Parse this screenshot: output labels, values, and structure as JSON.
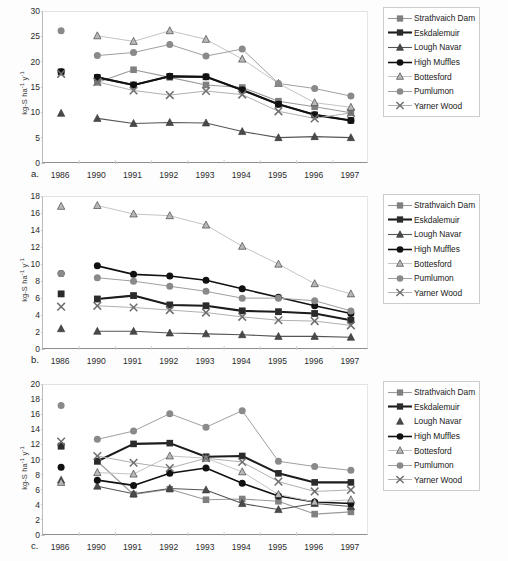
{
  "figure": {
    "panels": [
      "a",
      "b",
      "c"
    ],
    "x_categories": [
      "1986",
      "1990",
      "1991",
      "1992",
      "1993",
      "1994",
      "1995",
      "1996",
      "1997"
    ],
    "y_axis_title": "kg-S ha",
    "y_axis_title_sup1": "-1",
    "y_axis_title_mid": " y",
    "y_axis_title_sup2": "-1",
    "panel_label_a": "a.",
    "panel_label_b": "b.",
    "panel_label_c": "c."
  },
  "legend": {
    "entries": [
      {
        "label": "Strathvaich Dam",
        "marker": "square",
        "color": "#808080",
        "line_color": "#9a9a9a",
        "line_width": 1.1,
        "has_line": true
      },
      {
        "label": "Eskdalemuir",
        "marker": "square",
        "color": "#2b2b2b",
        "line_color": "#1c1c1c",
        "line_width": 2.1,
        "has_line": true
      },
      {
        "label": "Lough Navar",
        "marker": "triangle",
        "color": "#4a4a4a",
        "line_color": "#555555",
        "line_width": 1.1,
        "has_line": true
      },
      {
        "label": "High Muffles",
        "marker": "circle",
        "color": "#111111",
        "line_color": "#111111",
        "line_width": 1.6,
        "has_line": true
      },
      {
        "label": "Bottesford",
        "marker": "triangle",
        "color": "#b8b8b8",
        "line_color": "#c4c4c4",
        "line_width": 1.0,
        "has_line": true
      },
      {
        "label": "Pumlumon",
        "marker": "circle",
        "color": "#8a8a8a",
        "line_color": "#9f9f9f",
        "line_width": 1.0,
        "has_line": true
      },
      {
        "label": "Yarner Wood",
        "marker": "cross",
        "color": "#6e6e6e",
        "line_color": "#b0b0b0",
        "line_width": 1.0,
        "has_line": true
      }
    ],
    "legend_c_lough_navar_has_line": false
  },
  "chart_data": [
    {
      "type": "line",
      "panel": "a",
      "title": "",
      "xlabel": "",
      "ylabel": "kg-S ha-1 y-1",
      "x": [
        "1986",
        "1990",
        "1991",
        "1992",
        "1993",
        "1994",
        "1995",
        "1996",
        "1997"
      ],
      "ylim": [
        0,
        30
      ],
      "yticks": [
        0,
        5,
        10,
        15,
        20,
        25,
        30
      ],
      "grid": false,
      "legend_position": "right-outside",
      "series": [
        {
          "name": "Strathvaich Dam",
          "values": [
            null,
            16.1,
            18.6,
            17.1,
            15.6,
            15.1,
            12.4,
            11.3,
            10.1
          ]
        },
        {
          "name": "Eskdalemuir",
          "values": [
            18.2,
            17.1,
            15.6,
            17.3,
            17.2,
            14.6,
            11.8,
            9.7,
            8.6
          ]
        },
        {
          "name": "Lough Navar",
          "values": [
            10.0,
            9.0,
            8.0,
            8.2,
            8.1,
            6.4,
            5.2,
            5.4,
            5.2
          ]
        },
        {
          "name": "High Muffles",
          "values": [
            18.2,
            17.1,
            15.6,
            17.3,
            17.2,
            14.6,
            11.8,
            9.7,
            8.6
          ]
        },
        {
          "name": "Bottesford",
          "values": [
            null,
            25.3,
            24.2,
            26.3,
            24.6,
            20.7,
            15.9,
            12.1,
            11.2
          ]
        },
        {
          "name": "Pumlumon",
          "values": [
            26.3,
            21.4,
            22.0,
            23.6,
            21.3,
            22.7,
            15.9,
            14.9,
            13.4
          ]
        },
        {
          "name": "Yarner Wood",
          "values": [
            17.8,
            16.2,
            14.5,
            13.6,
            14.4,
            13.7,
            10.4,
            9.0,
            10.1
          ]
        }
      ]
    },
    {
      "type": "line",
      "panel": "b",
      "title": "",
      "xlabel": "",
      "ylabel": "kg-S ha-1 y-1",
      "x": [
        "1986",
        "1990",
        "1991",
        "1992",
        "1993",
        "1994",
        "1995",
        "1996",
        "1997"
      ],
      "ylim": [
        0,
        18
      ],
      "yticks": [
        0,
        2,
        4,
        6,
        8,
        10,
        12,
        14,
        16,
        18
      ],
      "grid": false,
      "legend_position": "right-outside",
      "series": [
        {
          "name": "Strathvaich Dam",
          "values": [
            6.6,
            6.0,
            6.4,
            5.3,
            5.2,
            4.6,
            4.5,
            4.3,
            3.5
          ]
        },
        {
          "name": "Eskdalemuir",
          "values": [
            6.6,
            6.0,
            6.4,
            5.3,
            5.2,
            4.6,
            4.5,
            4.3,
            3.5
          ]
        },
        {
          "name": "Lough Navar",
          "values": [
            2.5,
            2.2,
            2.2,
            2.0,
            1.9,
            1.8,
            1.6,
            1.6,
            1.5
          ]
        },
        {
          "name": "High Muffles",
          "values": [
            9.0,
            9.9,
            8.9,
            8.7,
            8.2,
            7.2,
            6.2,
            5.2,
            4.3
          ]
        },
        {
          "name": "Bottesford",
          "values": [
            16.9,
            17.0,
            16.0,
            15.8,
            14.7,
            12.2,
            10.1,
            7.8,
            6.6
          ]
        },
        {
          "name": "Pumlumon",
          "values": [
            9.0,
            8.5,
            8.1,
            7.5,
            6.9,
            6.1,
            6.1,
            5.8,
            4.6
          ]
        },
        {
          "name": "Yarner Wood",
          "values": [
            5.1,
            5.2,
            5.0,
            4.7,
            4.4,
            3.9,
            3.5,
            3.4,
            2.9
          ]
        }
      ]
    },
    {
      "type": "line",
      "panel": "c",
      "title": "",
      "xlabel": "",
      "ylabel": "kg-S ha-1 y-1",
      "x": [
        "1986",
        "1990",
        "1991",
        "1992",
        "1993",
        "1994",
        "1995",
        "1996",
        "1997"
      ],
      "ylim": [
        0,
        20
      ],
      "yticks": [
        0,
        2,
        4,
        6,
        8,
        10,
        12,
        14,
        16,
        18,
        20
      ],
      "grid": false,
      "legend_position": "right-outside",
      "series": [
        {
          "name": "Strathvaich Dam",
          "values": [
            11.9,
            9.9,
            5.5,
            6.2,
            4.8,
            4.9,
            4.6,
            2.9,
            3.2
          ]
        },
        {
          "name": "Eskdalemuir",
          "values": [
            11.9,
            9.9,
            12.2,
            12.3,
            10.5,
            10.6,
            8.3,
            7.1,
            7.1
          ]
        },
        {
          "name": "Lough Navar",
          "values": [
            7.4,
            6.6,
            5.6,
            6.3,
            6.1,
            4.3,
            3.5,
            4.3,
            3.9
          ]
        },
        {
          "name": "High Muffles",
          "values": [
            9.1,
            7.4,
            6.7,
            8.3,
            9.0,
            7.0,
            5.3,
            4.5,
            4.3
          ]
        },
        {
          "name": "Bottesford",
          "values": [
            7.1,
            8.4,
            8.2,
            10.6,
            10.3,
            8.5,
            5.5,
            4.5,
            4.8
          ]
        },
        {
          "name": "Pumlumon",
          "values": [
            17.3,
            12.8,
            13.9,
            16.2,
            14.4,
            16.6,
            9.9,
            9.2,
            8.7
          ]
        },
        {
          "name": "Yarner Wood",
          "values": [
            12.5,
            10.6,
            9.7,
            9.0,
            10.3,
            9.8,
            7.2,
            5.9,
            6.1
          ]
        }
      ]
    }
  ]
}
